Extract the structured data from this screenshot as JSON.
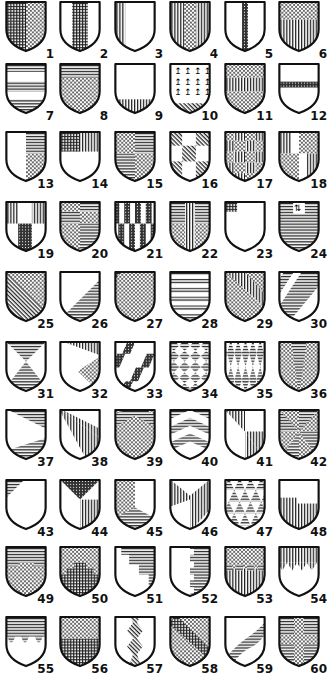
{
  "shields": [
    {
      "n": "1",
      "pattern": "per-pale grid / dots"
    },
    {
      "n": "2",
      "pattern": "pale grid on white"
    },
    {
      "n": "3",
      "pattern": "pale vertical stripes on white"
    },
    {
      "n": "4",
      "pattern": "pale dots on vertical"
    },
    {
      "n": "5",
      "pattern": "pallet dark"
    },
    {
      "n": "6",
      "pattern": "per-fess dots / vertical"
    },
    {
      "n": "7",
      "pattern": "bars horizontal"
    },
    {
      "n": "8",
      "pattern": "chief horizontal, dots"
    },
    {
      "n": "9",
      "pattern": "base vertical"
    },
    {
      "n": "10",
      "pattern": "ermine with base"
    },
    {
      "n": "11",
      "pattern": "fess vertical between dots"
    },
    {
      "n": "12",
      "pattern": "bar dark"
    },
    {
      "n": "13",
      "pattern": "per pale, dexter white, sinister horizontal over dots"
    },
    {
      "n": "14",
      "pattern": "chief grid/vertical"
    },
    {
      "n": "15",
      "pattern": "quarterly dots/horizontal"
    },
    {
      "n": "16",
      "pattern": "chequy diagonal"
    },
    {
      "n": "17",
      "pattern": "chequy dots/vertical"
    },
    {
      "n": "18",
      "pattern": "gyronny quarters"
    },
    {
      "n": "19",
      "pattern": "paly quartered"
    },
    {
      "n": "20",
      "pattern": "quarterly compound"
    },
    {
      "n": "21",
      "pattern": "paly counterchanged"
    },
    {
      "n": "22",
      "pattern": "cross vertical with dots"
    },
    {
      "n": "23",
      "pattern": "canton grid"
    },
    {
      "n": "24",
      "pattern": "horizontal with inescutcheon"
    },
    {
      "n": "25",
      "pattern": "per bend dots / diagonal"
    },
    {
      "n": "26",
      "pattern": "per bend sinister white / horizontal"
    },
    {
      "n": "27",
      "pattern": "per bend dots, canton grid"
    },
    {
      "n": "28",
      "pattern": "barry"
    },
    {
      "n": "29",
      "pattern": "bend vertical between dots"
    },
    {
      "n": "30",
      "pattern": "bendy"
    },
    {
      "n": "31",
      "pattern": "per saltire"
    },
    {
      "n": "32",
      "pattern": "per bend, dots"
    },
    {
      "n": "33",
      "pattern": "lozengy bendwise"
    },
    {
      "n": "34",
      "pattern": "lozengy"
    },
    {
      "n": "35",
      "pattern": "fusilly"
    },
    {
      "n": "36",
      "pattern": "pile horizontal on dots"
    },
    {
      "n": "37",
      "pattern": "per pile horizontal"
    },
    {
      "n": "38",
      "pattern": "gyronny of three"
    },
    {
      "n": "39",
      "pattern": "chevron horizontal between dots"
    },
    {
      "n": "40",
      "pattern": "chevronny"
    },
    {
      "n": "41",
      "pattern": "per saltire vertical"
    },
    {
      "n": "42",
      "pattern": "gyronny of eight"
    },
    {
      "n": "43",
      "pattern": "gyron horizontal"
    },
    {
      "n": "44",
      "pattern": "tierced in pairle"
    },
    {
      "n": "45",
      "pattern": "per pale, chevron"
    },
    {
      "n": "46",
      "pattern": "pall vertical"
    },
    {
      "n": "47",
      "pattern": "triangles"
    },
    {
      "n": "48",
      "pattern": "canton reverse vertical"
    },
    {
      "n": "49",
      "pattern": "embattled horizontal/dots"
    },
    {
      "n": "50",
      "pattern": "embattled grid/dots"
    },
    {
      "n": "51",
      "pattern": "indented steps"
    },
    {
      "n": "52",
      "pattern": "per pale dovetailed"
    },
    {
      "n": "53",
      "pattern": "per fess potent"
    },
    {
      "n": "54",
      "pattern": "per fess dancetty"
    },
    {
      "n": "55",
      "pattern": "per fess nebuly"
    },
    {
      "n": "56",
      "pattern": "per fess wavy"
    },
    {
      "n": "57",
      "pattern": "pale raguly"
    },
    {
      "n": "58",
      "pattern": "bend grid between dots"
    },
    {
      "n": "59",
      "pattern": "bend wavy"
    },
    {
      "n": "60",
      "pattern": "cross dots on horizontal"
    }
  ]
}
